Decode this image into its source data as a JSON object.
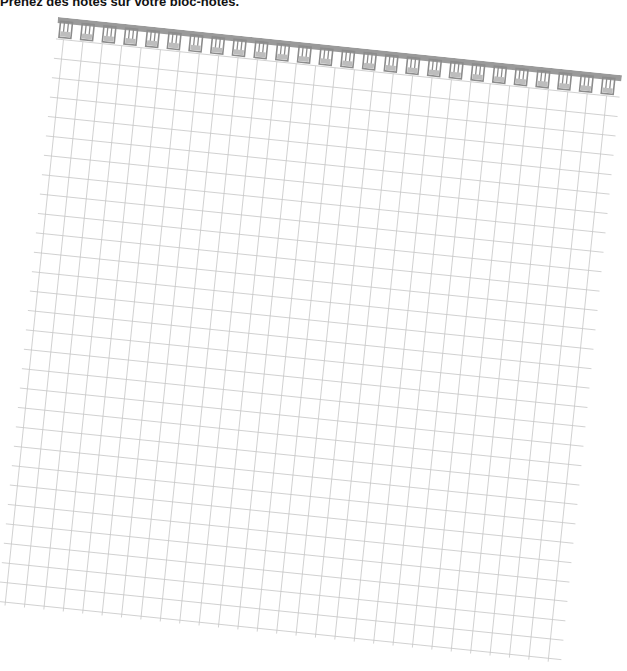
{
  "instruction": "Prenez des notes sur votre bloc-notes.",
  "notepad": {
    "type": "spiral-grid-notepad",
    "spiral_rings": 26,
    "grid_cell_px": 19.5,
    "colors": {
      "spiral_bar": "#9a9a9a",
      "ring": "#8c8c8c",
      "grid_line": "#c8c8c8",
      "paper": "#ffffff"
    }
  }
}
